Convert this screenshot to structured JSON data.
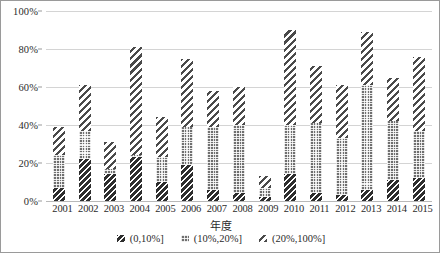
{
  "chart_data": {
    "type": "bar",
    "stacked": true,
    "title": "",
    "xlabel": "年度",
    "ylabel": "",
    "ylim": [
      0,
      100
    ],
    "yticks": [
      "0%",
      "20%",
      "40%",
      "60%",
      "80%",
      "100%"
    ],
    "ytick_values": [
      0,
      20,
      40,
      60,
      80,
      100
    ],
    "grid": true,
    "legend_position": "bottom",
    "categories": [
      "2001",
      "2002",
      "2003",
      "2004",
      "2005",
      "2006",
      "2007",
      "2008",
      "2009",
      "2010",
      "2011",
      "2012",
      "2013",
      "2014",
      "2015"
    ],
    "series": [
      {
        "name": "(0,10%]",
        "pattern": "dark-diagonal",
        "values": [
          7,
          22,
          14,
          23,
          10,
          19,
          6,
          4,
          2,
          14,
          4,
          3,
          6,
          11,
          12
        ]
      },
      {
        "name": "(10%,20%]",
        "pattern": "dotted-grey",
        "values": [
          17,
          15,
          3,
          1,
          13,
          20,
          33,
          36,
          5,
          26,
          37,
          30,
          55,
          31,
          25
        ]
      },
      {
        "name": "(20%,100%]",
        "pattern": "light-diagonal-stripe",
        "values": [
          15,
          24,
          14,
          57,
          21,
          36,
          19,
          20,
          6,
          50,
          30,
          28,
          28,
          23,
          39
        ]
      }
    ],
    "totals": [
      39,
      61,
      31,
      81,
      44,
      75,
      58,
      60,
      13,
      90,
      71,
      61,
      89,
      65,
      76
    ]
  }
}
